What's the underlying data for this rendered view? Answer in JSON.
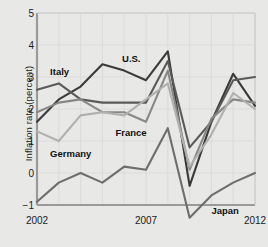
{
  "chart_data": {
    "type": "line",
    "title": "",
    "xlabel": "",
    "ylabel": "Inflation rate (percent)",
    "xlim": [
      2002,
      2012
    ],
    "ylim": [
      -1,
      5
    ],
    "yticks": [
      5,
      4,
      3,
      2,
      1,
      0,
      -1
    ],
    "ytick_labels": [
      "5",
      "4",
      "3",
      "2",
      "1",
      "0",
      "−1"
    ],
    "xticks": [
      2002,
      2007,
      2012
    ],
    "xtick_labels": [
      "2002",
      "2007",
      "2012"
    ],
    "grid": true,
    "legend_position": "inline-annotations",
    "x": [
      2002,
      2003,
      2004,
      2005,
      2006,
      2007,
      2008,
      2009,
      2010,
      2011,
      2012
    ],
    "series": [
      {
        "name": "U.S.",
        "color": "#3a3a3a",
        "values": [
          1.6,
          2.3,
          2.7,
          3.4,
          3.2,
          2.9,
          3.8,
          -0.4,
          1.6,
          3.1,
          2.1
        ]
      },
      {
        "name": "Italy",
        "color": "#5a5a5a",
        "values": [
          2.6,
          2.8,
          2.3,
          2.2,
          2.2,
          2.2,
          3.5,
          0.8,
          1.6,
          2.9,
          3.0
        ]
      },
      {
        "name": "France",
        "color": "#888888",
        "values": [
          1.9,
          2.2,
          2.3,
          1.9,
          1.9,
          1.6,
          3.2,
          0.1,
          1.7,
          2.3,
          2.2
        ]
      },
      {
        "name": "Germany",
        "color": "#b0b0b0",
        "values": [
          1.3,
          1.0,
          1.8,
          1.9,
          1.8,
          2.3,
          2.8,
          0.2,
          1.2,
          2.5,
          2.0
        ]
      },
      {
        "name": "Japan",
        "color": "#6e6e6e",
        "values": [
          -0.9,
          -0.3,
          0.0,
          -0.3,
          0.2,
          0.1,
          1.4,
          -1.4,
          -0.7,
          -0.3,
          0.0
        ]
      }
    ],
    "annotations": [
      {
        "text": "Italy",
        "x": 2002.6,
        "y": 3.15
      },
      {
        "text": "U.S.",
        "x": 2005.9,
        "y": 3.55
      },
      {
        "text": "France",
        "x": 2005.6,
        "y": 1.25
      },
      {
        "text": "Germany",
        "x": 2002.6,
        "y": 0.6
      },
      {
        "text": "Japan",
        "x": 2010.0,
        "y": -1.2
      }
    ]
  }
}
